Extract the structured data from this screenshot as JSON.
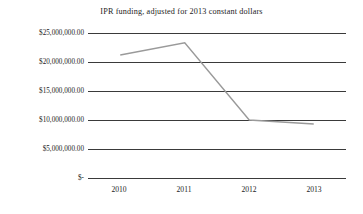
{
  "chart_data": {
    "type": "line",
    "title": "IPR funding, adjusted for 2013 constant dollars",
    "xlabel": "",
    "ylabel": "",
    "categories": [
      "2010",
      "2011",
      "2012",
      "2013"
    ],
    "series": [
      {
        "name": "IPR funding",
        "values": [
          21200000,
          23300000,
          10000000,
          9300000
        ]
      }
    ],
    "ylim": [
      0,
      25000000
    ],
    "yticks": [
      0,
      5000000,
      10000000,
      15000000,
      20000000,
      25000000
    ],
    "ytick_labels": [
      "$-",
      "$5,000,000.00",
      "$10,000,000.00",
      "$15,000,000.00",
      "$20,000,000.00",
      "$25,000,000.00"
    ],
    "xtick_labels": [
      "2010",
      "2011",
      "2012",
      "2013"
    ],
    "grid": true,
    "legend": "none",
    "colors": {
      "background": "#ffffff",
      "gridline": "#3a3a3a",
      "series_line": "#9a9a9a",
      "text": "#1c1c1c"
    }
  }
}
